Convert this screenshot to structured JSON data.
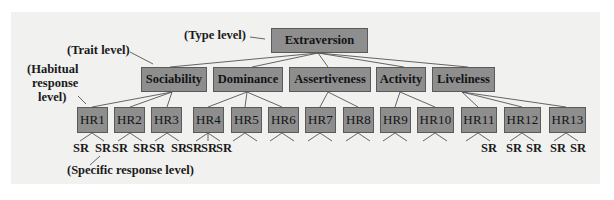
{
  "diagram": {
    "level_labels": {
      "type": "(Type level)",
      "trait": "(Trait level)",
      "habitual_line1": "(Habitual",
      "habitual_line2": "response",
      "habitual_line3": "level)",
      "specific": "(Specific response level)"
    },
    "type_node": "Extraversion",
    "traits": [
      "Sociability",
      "Dominance",
      "Assertiveness",
      "Activity",
      "Liveliness"
    ],
    "habitual_responses": [
      "HR1",
      "HR2",
      "HR3",
      "HR4",
      "HR5",
      "HR6",
      "HR7",
      "HR8",
      "HR9",
      "HR10",
      "HR11",
      "HR12",
      "HR13"
    ],
    "specific_response_label": "SR",
    "colors": {
      "background": "#f1f1ef",
      "node_fill": "#8e8e8e",
      "node_border": "#5a5a5a",
      "line": "#555555",
      "text": "#141414"
    }
  }
}
